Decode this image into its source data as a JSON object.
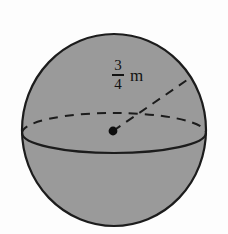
{
  "figure": {
    "shape": "sphere",
    "background_color": "#fdfdfd",
    "sphere": {
      "fill_color": "#9a9a9a",
      "outline_color": "#1c1c1c",
      "center_x": 114,
      "center_y": 130,
      "radius_x": 92,
      "radius_y": 96
    },
    "equator": {
      "front_style": "solid",
      "back_style": "dashed",
      "center_x": 114,
      "center_y": 133,
      "radius_x": 92,
      "radius_y": 20,
      "color": "#1c1c1c"
    },
    "center_point": {
      "label": "center-dot",
      "x": 113,
      "y": 131,
      "radius": 4.4,
      "color": "#0d0d0d"
    },
    "radius_segment": {
      "style": "dashed",
      "color": "#1c1c1c",
      "from_x": 113,
      "from_y": 131,
      "to_x": 190,
      "to_y": 78
    },
    "radius_label": {
      "numerator": "3",
      "denominator": "4",
      "unit": "m",
      "full_text": "3/4 m",
      "x": 112,
      "y": 58
    }
  }
}
